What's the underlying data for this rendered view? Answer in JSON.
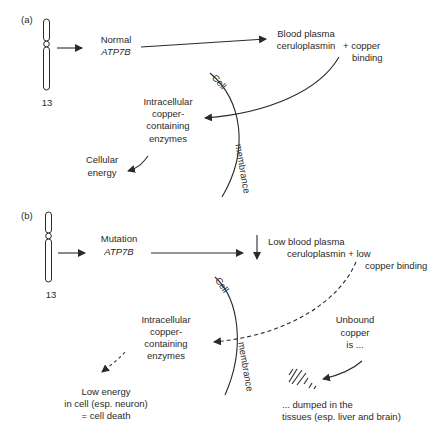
{
  "panel_a": {
    "label": "(a)",
    "chromosome_number": "13",
    "gene_line1": "Normal",
    "gene_line2": "ATP7B",
    "plasma_line1": "Blood plasma",
    "plasma_line2": "ceruloplasmin",
    "copper_line1": "+ copper",
    "copper_line2": "binding",
    "cell_label": "Cell",
    "membrane_label": "membrance",
    "enzymes_line1": "Intracellular",
    "enzymes_line2": "copper-",
    "enzymes_line3": "containing",
    "enzymes_line4": "enzymes",
    "energy_line1": "Cellular",
    "energy_line2": "energy"
  },
  "panel_b": {
    "label": "(b)",
    "chromosome_number": "13",
    "gene_line1": "Mutation",
    "gene_line2": "ATP7B",
    "plasma_line1": "Low blood plasma",
    "plasma_line2": "ceruloplasmin + low",
    "plasma_line3": "copper binding",
    "cell_label": "Cell",
    "membrane_label": "membrance",
    "enzymes_line1": "Intracellular",
    "enzymes_line2": "copper-",
    "enzymes_line3": "containing",
    "enzymes_line4": "enzymes",
    "death_line1": "Low energy",
    "death_line2": "in cell (esp. neuron)",
    "death_line3": "= cell death",
    "unbound_line1": "Unbound",
    "unbound_line2": "copper",
    "unbound_line3": "is ...",
    "dumped_line1": "... dumped in the",
    "dumped_line2": "tissues (esp. liver and brain)"
  },
  "colors": {
    "line": "#2a2a2a",
    "background": "#ffffff"
  }
}
